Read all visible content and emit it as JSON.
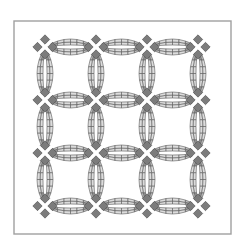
{
  "image": {
    "title": "Double Wedding Ring quilt pattern",
    "width": 245,
    "height": 248
  },
  "frame": {
    "x": 14,
    "y": 21,
    "width": 217,
    "height": 213,
    "stroke_color": "#a0a0a0",
    "fill_color": "#ffffff"
  },
  "pattern": {
    "name": "Double Wedding Ring",
    "grid_columns": 3,
    "grid_rows": 3,
    "junction_x": [
      45,
      96,
      147,
      198
    ],
    "junction_y": [
      47,
      100,
      153,
      206
    ],
    "arc_bulge": 11,
    "band_width": 6,
    "segments_per_band": 6,
    "colors": {
      "light_segment": "#dcdcdc",
      "mid_segment": "#bdbdbd",
      "dark_segment": "#9a9a9a",
      "corner_square": "#7c7c7c",
      "outline": "#5a5a5a",
      "background": "#ffffff"
    }
  }
}
